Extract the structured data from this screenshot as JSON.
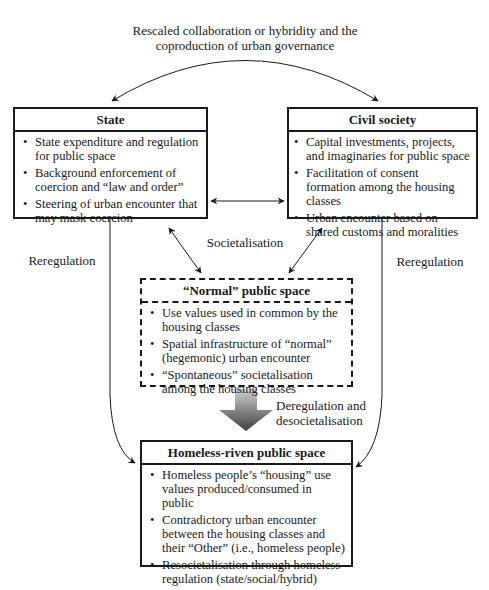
{
  "top_label": {
    "line1": "Rescaled collaboration or hybridity and the",
    "line2": "coproduction of urban governance"
  },
  "boxes": {
    "state": {
      "title": "State",
      "items": [
        "State expenditure and regulation for public space",
        "Background enforcement of coercion and “law and order”",
        "Steering of urban encounter that may mask coercion"
      ]
    },
    "civil": {
      "title": "Civil society",
      "items": [
        "Capital investments, projects, and imaginaries for public space",
        "Facilitation of consent formation among the housing classes",
        "Urban encounter based on shared customs and moralities"
      ]
    },
    "normal": {
      "title": "“Normal” public space",
      "items": [
        "Use values used in common by the housing classes",
        "Spatial infrastructure of “normal” (hegemonic) urban encounter",
        "“Spontaneous” societalisation among the housing classes"
      ]
    },
    "homeless": {
      "title": "Homeless-riven public space",
      "items": [
        "Homeless people’s “housing” use values produced/consumed in public",
        "Contradictory urban encounter between the housing classes and their “Other” (i.e., homeless people)",
        "Resocietalisation through homeless regulation (state/social/hybrid)"
      ]
    }
  },
  "labels": {
    "societalisation": "Societalisation",
    "reregulation_left": "Reregulation",
    "reregulation_right": "Reregulation",
    "deregulation_line1": "Deregulation and",
    "deregulation_line2": "desocietalisation"
  },
  "colors": {
    "ink": "#1a1a1a",
    "arrow_gradient_top": "#c8c8c8",
    "arrow_gradient_bottom": "#4a4a4a"
  }
}
